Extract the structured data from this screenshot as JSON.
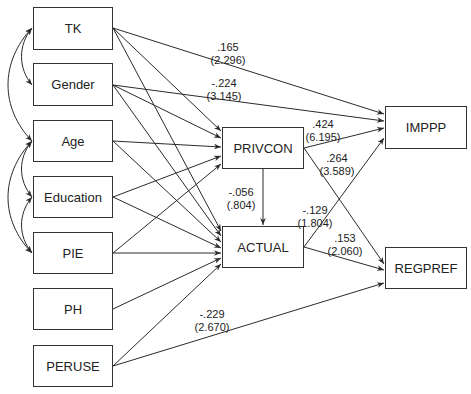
{
  "nodes": {
    "tk": {
      "label": "TK",
      "x": 33,
      "y": 7,
      "w": 80,
      "h": 43
    },
    "gender": {
      "label": "Gender",
      "x": 33,
      "y": 63,
      "w": 80,
      "h": 43
    },
    "age": {
      "label": "Age",
      "x": 33,
      "y": 120,
      "w": 80,
      "h": 42
    },
    "education": {
      "label": "Education",
      "x": 33,
      "y": 176,
      "w": 80,
      "h": 42
    },
    "pie": {
      "label": "PIE",
      "x": 33,
      "y": 232,
      "w": 80,
      "h": 42
    },
    "ph": {
      "label": "PH",
      "x": 33,
      "y": 288,
      "w": 80,
      "h": 42
    },
    "peruse": {
      "label": "PERUSE",
      "x": 33,
      "y": 345,
      "w": 80,
      "h": 42
    },
    "privcon": {
      "label": "PRIVCON",
      "x": 222,
      "y": 127,
      "w": 82,
      "h": 42
    },
    "actual": {
      "label": "ACTUAL",
      "x": 222,
      "y": 226,
      "w": 82,
      "h": 42
    },
    "imppp": {
      "label": "IMPPP",
      "x": 385,
      "y": 106,
      "w": 82,
      "h": 43
    },
    "regpref": {
      "label": "REGPREF",
      "x": 385,
      "y": 247,
      "w": 82,
      "h": 42
    }
  },
  "edges": [
    {
      "from": "TK",
      "to": "IMPPP",
      "x1": 113,
      "y1": 28,
      "x2": 384,
      "y2": 114
    },
    {
      "from": "TK",
      "to": "PRIVCON",
      "x1": 113,
      "y1": 28,
      "x2": 221,
      "y2": 131
    },
    {
      "from": "TK",
      "to": "ACTUAL",
      "x1": 113,
      "y1": 28,
      "x2": 221,
      "y2": 231
    },
    {
      "from": "Gender",
      "to": "IMPPP",
      "x1": 113,
      "y1": 85,
      "x2": 384,
      "y2": 121
    },
    {
      "from": "Gender",
      "to": "PRIVCON",
      "x1": 113,
      "y1": 85,
      "x2": 221,
      "y2": 138
    },
    {
      "from": "Gender",
      "to": "ACTUAL",
      "x1": 113,
      "y1": 85,
      "x2": 221,
      "y2": 236
    },
    {
      "from": "Age",
      "to": "PRIVCON",
      "x1": 113,
      "y1": 141,
      "x2": 221,
      "y2": 147
    },
    {
      "from": "Age",
      "to": "ACTUAL",
      "x1": 113,
      "y1": 141,
      "x2": 221,
      "y2": 242
    },
    {
      "from": "Education",
      "to": "PRIVCON",
      "x1": 113,
      "y1": 197,
      "x2": 221,
      "y2": 156
    },
    {
      "from": "Education",
      "to": "ACTUAL",
      "x1": 113,
      "y1": 197,
      "x2": 221,
      "y2": 248
    },
    {
      "from": "PIE",
      "to": "PRIVCON",
      "x1": 113,
      "y1": 253,
      "x2": 221,
      "y2": 164
    },
    {
      "from": "PIE",
      "to": "ACTUAL",
      "x1": 113,
      "y1": 253,
      "x2": 221,
      "y2": 253
    },
    {
      "from": "PH",
      "to": "ACTUAL",
      "x1": 113,
      "y1": 309,
      "x2": 221,
      "y2": 258
    },
    {
      "from": "PERUSE",
      "to": "ACTUAL",
      "x1": 113,
      "y1": 366,
      "x2": 221,
      "y2": 264
    },
    {
      "from": "PERUSE",
      "to": "REGPREF",
      "x1": 113,
      "y1": 366,
      "x2": 384,
      "y2": 283
    },
    {
      "from": "PRIVCON",
      "to": "ACTUAL",
      "x1": 263,
      "y1": 169,
      "x2": 263,
      "y2": 225
    },
    {
      "from": "PRIVCON",
      "to": "IMPPP",
      "x1": 304,
      "y1": 148,
      "x2": 384,
      "y2": 128
    },
    {
      "from": "PRIVCON",
      "to": "REGPREF",
      "x1": 304,
      "y1": 148,
      "x2": 384,
      "y2": 264
    },
    {
      "from": "ACTUAL",
      "to": "IMPPP",
      "x1": 304,
      "y1": 247,
      "x2": 384,
      "y2": 138
    },
    {
      "from": "ACTUAL",
      "to": "REGPREF",
      "x1": 304,
      "y1": 247,
      "x2": 384,
      "y2": 270
    }
  ],
  "covariances": [
    {
      "between": [
        "TK",
        "Gender"
      ],
      "d": "M32,28 C18,45 18,68 32,85"
    },
    {
      "between": [
        "TK",
        "Age"
      ],
      "d": "M32,28 C0,62 0,108 32,141"
    },
    {
      "between": [
        "Age",
        "Education"
      ],
      "d": "M32,141 C18,158 18,180 32,197"
    },
    {
      "between": [
        "Age",
        "PIE"
      ],
      "d": "M32,141 C0,175 0,220 32,253"
    },
    {
      "between": [
        "Education",
        "PIE"
      ],
      "d": "M32,197 C18,214 18,236 32,253"
    }
  ],
  "labels": {
    "tk_imppp": {
      "coef": ".165",
      "t": "(2.296)",
      "x": 228,
      "y": 41
    },
    "gender_imppp": {
      "coef": "-.224",
      "t": "(3.145)",
      "x": 224,
      "y": 77
    },
    "privcon_imppp": {
      "coef": ".424",
      "t": "(6.195)",
      "x": 323,
      "y": 118
    },
    "privcon_regpref": {
      "coef": ".264",
      "t": "(3.589)",
      "x": 337,
      "y": 152
    },
    "privcon_actual": {
      "coef": "-.056",
      "t": "(.804)",
      "x": 241,
      "y": 186
    },
    "actual_imppp": {
      "coef": "-.129",
      "t": "(1.804)",
      "x": 315,
      "y": 204
    },
    "actual_regpref": {
      "coef": ".153",
      "t": "(2.060)",
      "x": 345,
      "y": 232
    },
    "peruse_regpref": {
      "coef": "-.229",
      "t": "(2.670)",
      "x": 212,
      "y": 308
    }
  },
  "colors": {
    "line": "#2a2a2a",
    "box_border": "#333333",
    "text": "#222222"
  }
}
